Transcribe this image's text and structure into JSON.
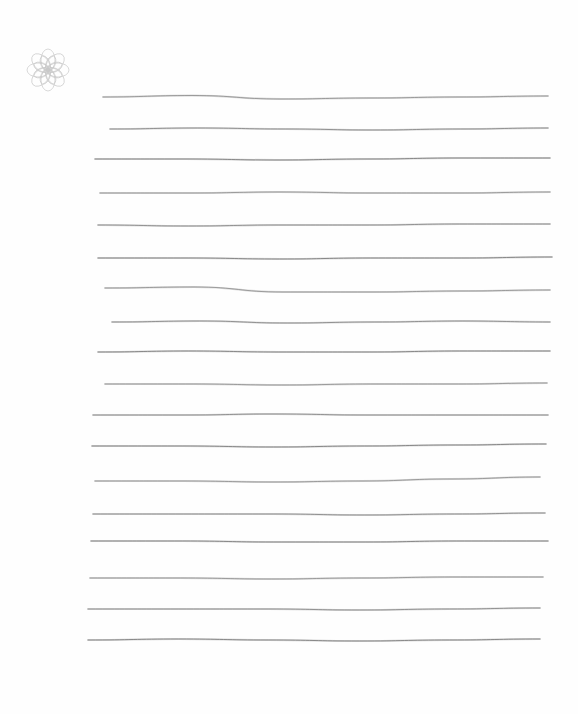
{
  "document": {
    "type": "lined-paper",
    "ornament": {
      "icon": "rosette-icon",
      "color": "#c8c8c8",
      "center": [
        48,
        70
      ],
      "size": 44
    },
    "ruling": {
      "color": "#6e6e6e",
      "line_count": 18,
      "lines": [
        {
          "y": 97,
          "x1": 103,
          "x2": 548,
          "wobble": [
            0,
            -1.5,
            2,
            1,
            0,
            -1
          ]
        },
        {
          "y": 129,
          "x1": 110,
          "x2": 548,
          "wobble": [
            0,
            -1,
            0,
            1,
            0,
            -1
          ]
        },
        {
          "y": 159,
          "x1": 95,
          "x2": 550,
          "wobble": [
            0,
            0,
            1,
            0,
            -1,
            -1
          ]
        },
        {
          "y": 193,
          "x1": 100,
          "x2": 550,
          "wobble": [
            0,
            0,
            -1,
            0,
            0,
            -1
          ]
        },
        {
          "y": 225,
          "x1": 98,
          "x2": 550,
          "wobble": [
            0,
            1,
            0,
            0,
            -1,
            -1
          ]
        },
        {
          "y": 258,
          "x1": 98,
          "x2": 552,
          "wobble": [
            0,
            0,
            1,
            0,
            0,
            -1
          ]
        },
        {
          "y": 291,
          "x1": 105,
          "x2": 550,
          "wobble": [
            -3,
            -4,
            1,
            1,
            0,
            -1
          ]
        },
        {
          "y": 322,
          "x1": 112,
          "x2": 550,
          "wobble": [
            0,
            -1,
            1,
            0,
            -1,
            0
          ]
        },
        {
          "y": 352,
          "x1": 98,
          "x2": 550,
          "wobble": [
            0,
            -1,
            0,
            0,
            -1,
            -1
          ]
        },
        {
          "y": 384,
          "x1": 105,
          "x2": 547,
          "wobble": [
            0,
            0,
            1,
            0,
            0,
            -1
          ]
        },
        {
          "y": 415,
          "x1": 93,
          "x2": 548,
          "wobble": [
            0,
            0,
            -1,
            0,
            0,
            0
          ]
        },
        {
          "y": 446,
          "x1": 92,
          "x2": 546,
          "wobble": [
            0,
            0,
            1,
            0,
            -1,
            -2
          ]
        },
        {
          "y": 481,
          "x1": 95,
          "x2": 540,
          "wobble": [
            0,
            0,
            1,
            0,
            -2,
            -4
          ]
        },
        {
          "y": 514,
          "x1": 93,
          "x2": 545,
          "wobble": [
            0,
            0,
            0,
            1,
            0,
            -1
          ]
        },
        {
          "y": 541,
          "x1": 91,
          "x2": 548,
          "wobble": [
            0,
            0,
            1,
            1,
            0,
            0
          ]
        },
        {
          "y": 578,
          "x1": 90,
          "x2": 543,
          "wobble": [
            0,
            0,
            1,
            0,
            -1,
            -1
          ]
        },
        {
          "y": 609,
          "x1": 88,
          "x2": 540,
          "wobble": [
            0,
            0,
            0,
            1,
            0,
            -1
          ]
        },
        {
          "y": 640,
          "x1": 88,
          "x2": 540,
          "wobble": [
            0,
            -1,
            0,
            1,
            0,
            -1
          ]
        }
      ]
    },
    "caption": "Blank hand-ruled writing page"
  }
}
